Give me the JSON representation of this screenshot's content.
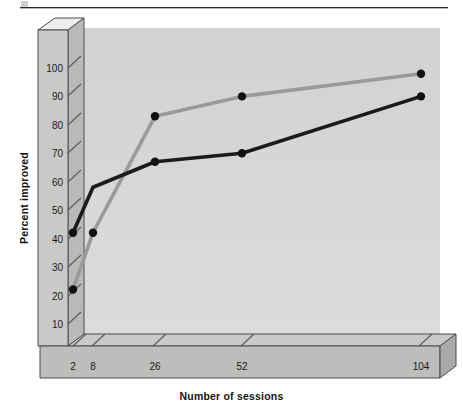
{
  "page": {
    "background": "#ffffff",
    "has_top_rule": true
  },
  "chart_data": {
    "type": "line",
    "title": "",
    "xlabel": "Number of sessions",
    "ylabel": "Percent improved",
    "categories": [
      "2",
      "8",
      "26",
      "52",
      "104"
    ],
    "x_tick_labels": [
      "2",
      "8",
      "26",
      "52",
      "104"
    ],
    "y_tick_labels": [
      "0",
      "10",
      "20",
      "30",
      "40",
      "50",
      "60",
      "70",
      "80",
      "90",
      "100"
    ],
    "y_ticks": [
      0,
      10,
      20,
      30,
      40,
      50,
      60,
      70,
      80,
      90,
      100
    ],
    "ylim": [
      0,
      100
    ],
    "grid": false,
    "legend": "none",
    "style": "3d-axes-grayscale",
    "series": [
      {
        "name": "gray-series",
        "color": "#9a9a9a",
        "marker": "circle",
        "marker_color": "#111111",
        "values": [
          22,
          42,
          83,
          90,
          98
        ],
        "markers_shown": [
          true,
          true,
          true,
          true,
          true
        ]
      },
      {
        "name": "dark-series",
        "color": "#1b1b1b",
        "marker": "circle",
        "marker_color": "#111111",
        "values": [
          42,
          58,
          67,
          70,
          90
        ],
        "markers_shown": [
          true,
          false,
          true,
          true,
          true
        ]
      }
    ]
  },
  "colors": {
    "plot_background": "#d7d7d5",
    "axis_face": "#c4c4c2",
    "axis_top": "#e9e9e7",
    "axis_edge": "#4a4a4a",
    "dark_series": "#1b1b1b",
    "gray_series": "#9a9a9a",
    "marker": "#111111",
    "text": "#1a1a1a"
  }
}
